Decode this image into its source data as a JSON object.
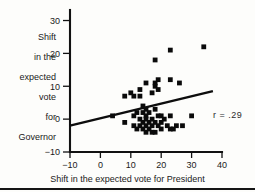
{
  "chart_data": {
    "type": "scatter",
    "title": "",
    "xlabel": "Shift in the expected vote for President",
    "ylabel": "Shift in the expected vote for Governor",
    "ylabel_lines": [
      "Shift",
      "in the",
      "expected",
      "vote",
      "for",
      "Governor"
    ],
    "xlim": [
      -10,
      40
    ],
    "ylim": [
      -10,
      30
    ],
    "xticks": [
      -10,
      0,
      10,
      20,
      30,
      40
    ],
    "xtick_labels": [
      "−10",
      "0",
      "10",
      "20",
      "30",
      "40"
    ],
    "yticks": [
      -10,
      0,
      10,
      20,
      30
    ],
    "ytick_labels": [
      "−10",
      "0",
      "10",
      "20",
      "30"
    ],
    "grid": false,
    "legend": "none",
    "annotations": [
      {
        "text": "r  =  .29",
        "x": 33,
        "y": -1
      }
    ],
    "marker_color": "#0a0a0a",
    "marker_size": 2.4,
    "series": [
      {
        "name": "States",
        "points": [
          [
            4,
            1
          ],
          [
            8,
            -1
          ],
          [
            8,
            7
          ],
          [
            10,
            8
          ],
          [
            11,
            7
          ],
          [
            11,
            1
          ],
          [
            11,
            -2
          ],
          [
            12,
            2
          ],
          [
            12,
            -3
          ],
          [
            13,
            9
          ],
          [
            13,
            7
          ],
          [
            13,
            0
          ],
          [
            13,
            -2
          ],
          [
            14,
            4
          ],
          [
            14,
            2
          ],
          [
            14,
            -1
          ],
          [
            14,
            -3
          ],
          [
            15,
            11
          ],
          [
            15,
            3
          ],
          [
            15,
            1
          ],
          [
            15,
            0
          ],
          [
            15,
            -2
          ],
          [
            15,
            -4
          ],
          [
            16,
            2
          ],
          [
            16,
            -1
          ],
          [
            16,
            -3
          ],
          [
            17,
            8
          ],
          [
            17,
            0
          ],
          [
            17,
            -2
          ],
          [
            17,
            -4
          ],
          [
            18,
            18
          ],
          [
            18,
            11
          ],
          [
            18,
            10
          ],
          [
            18,
            3
          ],
          [
            18,
            -1
          ],
          [
            18,
            -4
          ],
          [
            19,
            12
          ],
          [
            19,
            9
          ],
          [
            19,
            1
          ],
          [
            19,
            -2
          ],
          [
            20,
            1
          ],
          [
            20,
            -1
          ],
          [
            20,
            -3
          ],
          [
            21,
            0
          ],
          [
            22,
            -2
          ],
          [
            23,
            21
          ],
          [
            23,
            12
          ],
          [
            23,
            1
          ],
          [
            23,
            -3
          ],
          [
            24,
            -3
          ],
          [
            25,
            -2
          ],
          [
            26,
            11
          ],
          [
            27,
            -2
          ],
          [
            30,
            1
          ],
          [
            34,
            22
          ]
        ]
      }
    ],
    "trendline": {
      "label": "regression line",
      "x_start": -10,
      "y_start": -2,
      "x_end": 37,
      "y_end": 8.5
    }
  }
}
